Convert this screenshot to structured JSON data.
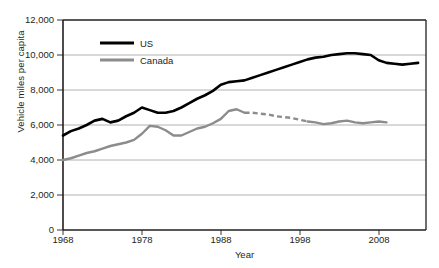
{
  "chart_data": {
    "type": "line",
    "title": "",
    "xlabel": "Year",
    "ylabel": "Vehicle miles per capita",
    "xlim": [
      1968,
      2014
    ],
    "ylim": [
      0,
      12000
    ],
    "xticks": [
      1968,
      1978,
      1988,
      1998,
      2008
    ],
    "yticks": [
      0,
      2000,
      4000,
      6000,
      8000,
      10000,
      12000
    ],
    "ytick_labels": [
      "0",
      "2,000",
      "4,000",
      "6,000",
      "8,000",
      "10,000",
      "12,000"
    ],
    "xtick_labels": [
      "1968",
      "1978",
      "1988",
      "1998",
      "2008"
    ],
    "grid": "horizontal",
    "legend_position": "top-center-left",
    "series": [
      {
        "name": "US",
        "color": "#000000",
        "style": "solid",
        "x": [
          1968,
          1969,
          1970,
          1971,
          1972,
          1973,
          1974,
          1975,
          1976,
          1977,
          1978,
          1979,
          1980,
          1981,
          1982,
          1983,
          1984,
          1985,
          1986,
          1987,
          1988,
          1989,
          1990,
          1991,
          1992,
          1993,
          1994,
          1995,
          1996,
          1997,
          1998,
          1999,
          2000,
          2001,
          2002,
          2003,
          2004,
          2005,
          2006,
          2007,
          2008,
          2009,
          2010,
          2011,
          2012,
          2013
        ],
        "values": [
          5400,
          5650,
          5800,
          6000,
          6250,
          6350,
          6150,
          6250,
          6500,
          6700,
          7000,
          6850,
          6700,
          6700,
          6800,
          7000,
          7250,
          7500,
          7700,
          7950,
          8300,
          8450,
          8500,
          8550,
          8700,
          8850,
          9000,
          9150,
          9300,
          9450,
          9600,
          9750,
          9850,
          9900,
          10000,
          10050,
          10100,
          10100,
          10050,
          10000,
          9700,
          9550,
          9500,
          9450,
          9500,
          9550
        ]
      },
      {
        "name": "Canada",
        "color": "#8c8c8c",
        "style": "solid-with-dashed-gap",
        "dashed_range": [
          1991,
          1999
        ],
        "x": [
          1968,
          1969,
          1970,
          1971,
          1972,
          1973,
          1974,
          1975,
          1976,
          1977,
          1978,
          1979,
          1980,
          1981,
          1982,
          1983,
          1984,
          1985,
          1986,
          1987,
          1988,
          1989,
          1990,
          1991,
          1992,
          1993,
          1994,
          1995,
          1996,
          1997,
          1998,
          1999,
          2000,
          2001,
          2002,
          2003,
          2004,
          2005,
          2006,
          2007,
          2008,
          2009
        ],
        "values": [
          4000,
          4100,
          4250,
          4400,
          4500,
          4650,
          4800,
          4900,
          5000,
          5150,
          5500,
          5950,
          5900,
          5700,
          5400,
          5400,
          5600,
          5800,
          5900,
          6100,
          6350,
          6800,
          6900,
          6700,
          6700,
          6650,
          6600,
          6500,
          6450,
          6400,
          6300,
          6200,
          6150,
          6050,
          6100,
          6200,
          6250,
          6150,
          6100,
          6150,
          6200,
          6150
        ]
      }
    ]
  },
  "legend": {
    "us_label": "US",
    "canada_label": "Canada"
  },
  "axes": {
    "y_label": "Vehicle miles per capita",
    "x_label": "Year"
  }
}
